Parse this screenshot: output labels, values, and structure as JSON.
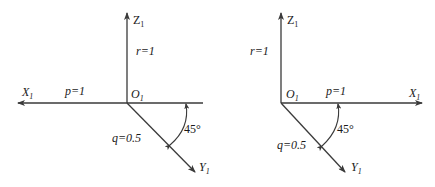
{
  "figure": {
    "left": {
      "origin_label": "O",
      "origin_sub": "1",
      "x_axis": {
        "label": "X",
        "sub": "1",
        "direction": "left"
      },
      "y_axis": {
        "label": "Y",
        "sub": "1",
        "direction": "down-right"
      },
      "z_axis": {
        "label": "Z",
        "sub": "1",
        "direction": "up"
      },
      "p_label": "p=1",
      "q_label": "q=0.5",
      "r_label": "r=1",
      "angle_label": "45°"
    },
    "right": {
      "origin_label": "O",
      "origin_sub": "1",
      "x_axis": {
        "label": "X",
        "sub": "1",
        "direction": "right"
      },
      "y_axis": {
        "label": "Y",
        "sub": "1",
        "direction": "down-right"
      },
      "z_axis": {
        "label": "Z",
        "sub": "1",
        "direction": "up"
      },
      "p_label": "p=1",
      "q_label": "q=0.5",
      "r_label": "r=1",
      "angle_label": "45°"
    }
  },
  "colors": {
    "line": "#3a3a3a",
    "text": "#1a1a1a",
    "background": "#ffffff"
  }
}
